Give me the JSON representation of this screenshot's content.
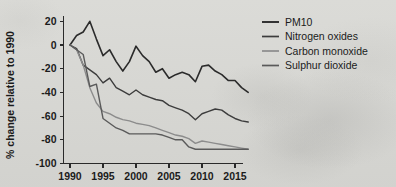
{
  "chart_data": {
    "type": "line",
    "title": "",
    "xlabel": "",
    "ylabel": "% change relative to 1990",
    "xlim": [
      1989,
      2018
    ],
    "ylim": [
      -100,
      25
    ],
    "grid": false,
    "legend_position": "right",
    "xticks": [
      1990,
      1995,
      2000,
      2005,
      2010,
      2015
    ],
    "xticklabels": [
      "1990",
      "1995",
      "2000",
      "2005",
      "2010",
      "2015"
    ],
    "yticks": [
      20,
      0,
      -20,
      -40,
      -60,
      -80,
      -100
    ],
    "yticklabels": [
      "20",
      "0",
      "-20",
      "-40",
      "-60",
      "-80",
      "-100"
    ],
    "x": [
      1990,
      1991,
      1992,
      1993,
      1994,
      1995,
      1996,
      1997,
      1998,
      1999,
      2000,
      2001,
      2002,
      2003,
      2004,
      2005,
      2006,
      2007,
      2008,
      2009,
      2010,
      2011,
      2012,
      2013,
      2014,
      2015,
      2016,
      2017
    ],
    "series": [
      {
        "name": "PM10",
        "color": "#2b2b2b",
        "width": 1.6,
        "values": [
          0,
          8,
          11,
          20,
          5,
          -9,
          -4,
          -14,
          -22,
          -14,
          -1,
          -9,
          -14,
          -23,
          -20,
          -28,
          -25,
          -23,
          -25,
          -31,
          -18,
          -17,
          -22,
          -25,
          -30,
          -30,
          -36,
          -40
        ]
      },
      {
        "name": "Nitrogen oxides",
        "color": "#3c3c3c",
        "width": 1.4,
        "values": [
          0,
          -3,
          -17,
          -21,
          -25,
          -32,
          -28,
          -36,
          -39,
          -42,
          -38,
          -42,
          -44,
          -46,
          -47,
          -51,
          -53,
          -55,
          -58,
          -63,
          -58,
          -56,
          -54,
          -55,
          -59,
          -62,
          -64,
          -65
        ]
      },
      {
        "name": "Carbon monoxide",
        "color": "#8c8c8c",
        "width": 1.4,
        "values": [
          0,
          -4,
          -17,
          -36,
          -49,
          -56,
          -58,
          -61,
          -63,
          -64,
          -66,
          -67,
          -68,
          -70,
          -72,
          -74,
          -76,
          -77,
          -79,
          -83,
          -81,
          -82,
          -83,
          -84,
          -85,
          -86,
          -87,
          -88
        ]
      },
      {
        "name": "Sulphur dioxide",
        "color": "#5a5a5a",
        "width": 1.4,
        "values": [
          0,
          -4,
          -8,
          -35,
          -33,
          -62,
          -66,
          -70,
          -72,
          -75,
          -75,
          -75,
          -75,
          -75,
          -76,
          -78,
          -80,
          -80,
          -86,
          -88,
          -88,
          -88,
          -88,
          -88,
          -88,
          -88,
          -88,
          -88
        ]
      }
    ]
  },
  "legend": {
    "items": [
      {
        "label": "PM10"
      },
      {
        "label": "Nitrogen oxides"
      },
      {
        "label": "Carbon monoxide"
      },
      {
        "label": "Sulphur dioxide"
      }
    ]
  }
}
